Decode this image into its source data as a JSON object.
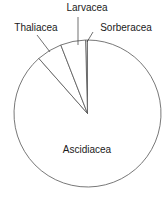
{
  "chart_data": {
    "type": "pie",
    "title": "",
    "start_angle_deg": -1.5,
    "direction": "clockwise",
    "slices": [
      {
        "label": "Sorberacea",
        "value": 0.4
      },
      {
        "label": "Ascidiacea",
        "value": 88.5
      },
      {
        "label": "Thaliacea",
        "value": 5.6
      },
      {
        "label": "Larvacea",
        "value": 5.5
      }
    ],
    "categories": [
      "Sorberacea",
      "Ascidiacea",
      "Thaliacea",
      "Larvacea"
    ],
    "values": [
      0.4,
      88.5,
      5.6,
      5.5
    ],
    "legend": "none (direct labels)",
    "fill_color": "#ffffff",
    "stroke_color": "#555555"
  },
  "labels": {
    "larvacea": "Larvacea",
    "thaliacea": "Thaliacea",
    "sorberacea": "Sorberacea",
    "ascidiacea": "Ascidiacea"
  },
  "geometry": {
    "cx": 87.5,
    "cy": 113.5,
    "r": 73.5
  }
}
